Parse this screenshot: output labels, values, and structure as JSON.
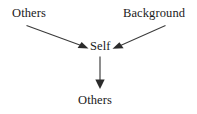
{
  "diagram": {
    "type": "flow-diagram",
    "background_color": "#ffffff",
    "line_color": "#3a3a3a",
    "text_color": "#1a1a1a",
    "nodes": [
      {
        "id": "others_left",
        "label": "Others",
        "position": "top-left"
      },
      {
        "id": "background",
        "label": "Background",
        "position": "top-right"
      },
      {
        "id": "self",
        "label": "Self",
        "position": "center"
      },
      {
        "id": "others_bottom",
        "label": "Others",
        "position": "bottom-center"
      }
    ],
    "edges": [
      {
        "from": "others_left",
        "to": "self",
        "arrow": "single",
        "direction": "down-right"
      },
      {
        "from": "background",
        "to": "self",
        "arrow": "single",
        "direction": "down-left"
      },
      {
        "from": "self",
        "to": "others_bottom",
        "arrow": "single",
        "direction": "down"
      }
    ]
  }
}
